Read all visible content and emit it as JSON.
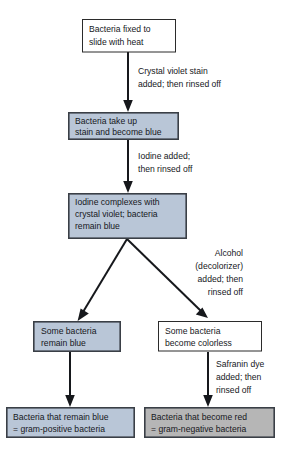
{
  "diagram": {
    "colors": {
      "blue_fill": "#b9c6d7",
      "gray_fill": "#b6b6b6",
      "white_fill": "#ffffff",
      "line": "#16181c",
      "border": "#3a3f46"
    },
    "nodes": [
      {
        "id": "fixed",
        "style": "white",
        "lines": [
          "Bacteria fixed to",
          "slide with heat"
        ]
      },
      {
        "id": "take-up-stain",
        "style": "blue",
        "lines": [
          "Bacteria take up",
          "stain and become blue"
        ]
      },
      {
        "id": "iodine-complexes",
        "style": "blue",
        "lines": [
          "Iodine complexes with",
          "crystal violet; bacteria",
          "remain blue"
        ]
      },
      {
        "id": "remain-blue",
        "style": "blue",
        "lines": [
          "Some bacteria",
          "remain blue"
        ]
      },
      {
        "id": "become-colorless",
        "style": "white",
        "lines": [
          "Some bacteria",
          "become colorless"
        ]
      },
      {
        "id": "gram-positive",
        "style": "blue",
        "lines": [
          "Bacteria that remain blue",
          "= gram-positive bacteria"
        ]
      },
      {
        "id": "gram-negative",
        "style": "gray",
        "lines": [
          "Bacteria that become red",
          "= gram-negative bacteria"
        ]
      }
    ],
    "edge_labels": [
      {
        "id": "crystal-violet",
        "align": "start",
        "lines": [
          "Crystal violet stain",
          "added; then rinsed off"
        ]
      },
      {
        "id": "iodine-added",
        "align": "start",
        "lines": [
          "Iodine added;",
          "then rinsed off"
        ]
      },
      {
        "id": "alcohol-decolorizer",
        "align": "end",
        "lines": [
          "Alcohol",
          "(decolorizer)",
          "added; then",
          "rinsed off"
        ]
      },
      {
        "id": "safranin-dye",
        "align": "start",
        "lines": [
          "Safranin dye",
          "added; then",
          "rinsed off"
        ]
      }
    ]
  }
}
